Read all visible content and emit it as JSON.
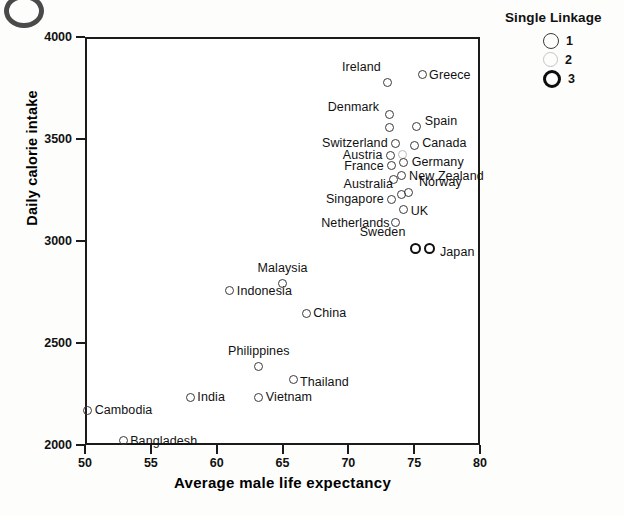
{
  "chart_data": {
    "type": "scatter",
    "title": "",
    "xlabel": "Average male life expectancy",
    "ylabel": "Daily calorie intake",
    "xlim": [
      50,
      80
    ],
    "ylim": [
      2000,
      4000
    ],
    "xticks": [
      50,
      55,
      60,
      65,
      70,
      75,
      80
    ],
    "yticks": [
      2000,
      2500,
      3000,
      3500,
      4000
    ],
    "grid": false,
    "legend": {
      "title": "Single Linkage",
      "position": "top-right-outside",
      "entries": [
        {
          "label": "1",
          "weight": "thin"
        },
        {
          "label": "2",
          "weight": "faint"
        },
        {
          "label": "3",
          "weight": "bold"
        }
      ]
    },
    "points": [
      {
        "name": "Ireland",
        "x": 73.0,
        "y": 3775,
        "linkage": 1,
        "label_pos": "r",
        "label_dx": -7,
        "label_dy": -16
      },
      {
        "name": "Greece",
        "x": 75.6,
        "y": 3815,
        "linkage": 1,
        "label_pos": "l",
        "label_dx": 7,
        "label_dy": 0
      },
      {
        "name": "Denmark",
        "x": 73.1,
        "y": 3620,
        "linkage": 1,
        "label_pos": "r",
        "label_dx": -10,
        "label_dy": -8
      },
      {
        "name": "Denmark2",
        "x": 73.1,
        "y": 3555,
        "linkage": 1,
        "label_pos": "none",
        "label_dx": 0,
        "label_dy": 0
      },
      {
        "name": "Spain",
        "x": 75.2,
        "y": 3560,
        "linkage": 1,
        "label_pos": "l",
        "label_dx": 8,
        "label_dy": -6
      },
      {
        "name": "Switzerland",
        "x": 73.6,
        "y": 3480,
        "linkage": 1,
        "label_pos": "r",
        "label_dx": -8,
        "label_dy": 0
      },
      {
        "name": "Canada",
        "x": 75.0,
        "y": 3470,
        "linkage": 1,
        "label_pos": "l",
        "label_dx": 8,
        "label_dy": -2
      },
      {
        "name": "Austria",
        "x": 73.2,
        "y": 3420,
        "linkage": 1,
        "label_pos": "r",
        "label_dx": -8,
        "label_dy": 0
      },
      {
        "name": "Austria2",
        "x": 74.1,
        "y": 3425,
        "linkage": 2,
        "label_pos": "none",
        "label_dx": 0,
        "label_dy": 0
      },
      {
        "name": "Germany",
        "x": 74.2,
        "y": 3385,
        "linkage": 1,
        "label_pos": "l",
        "label_dx": 8,
        "label_dy": 0
      },
      {
        "name": "France",
        "x": 73.3,
        "y": 3370,
        "linkage": 1,
        "label_pos": "r",
        "label_dx": -8,
        "label_dy": 0
      },
      {
        "name": "New Zealand",
        "x": 74.0,
        "y": 3320,
        "linkage": 1,
        "label_pos": "l",
        "label_dx": 8,
        "label_dy": 0
      },
      {
        "name": "NZ2",
        "x": 73.4,
        "y": 3300,
        "linkage": 1,
        "label_pos": "none",
        "label_dx": 0,
        "label_dy": 0
      },
      {
        "name": "Australia",
        "x": 74.0,
        "y": 3230,
        "linkage": 1,
        "label_pos": "r",
        "label_dx": -8,
        "label_dy": -10
      },
      {
        "name": "Norway",
        "x": 74.6,
        "y": 3240,
        "linkage": 1,
        "label_pos": "l",
        "label_dx": 10,
        "label_dy": -10
      },
      {
        "name": "Singapore",
        "x": 73.3,
        "y": 3205,
        "linkage": 1,
        "label_pos": "r",
        "label_dx": -8,
        "label_dy": 0
      },
      {
        "name": "UK",
        "x": 74.2,
        "y": 3155,
        "linkage": 1,
        "label_pos": "l",
        "label_dx": 7,
        "label_dy": 2
      },
      {
        "name": "Netherlands",
        "x": 73.6,
        "y": 3090,
        "linkage": 1,
        "label_pos": "r",
        "label_dx": -6,
        "label_dy": 0
      },
      {
        "name": "Sweden",
        "x": 75.1,
        "y": 2965,
        "linkage": 3,
        "label_pos": "r",
        "label_dx": -10,
        "label_dy": -16
      },
      {
        "name": "Japan",
        "x": 76.2,
        "y": 2965,
        "linkage": 3,
        "label_pos": "l",
        "label_dx": 10,
        "label_dy": 4
      },
      {
        "name": "Malaysia",
        "x": 65.0,
        "y": 2790,
        "linkage": 1,
        "label_pos": "c",
        "label_dx": 0,
        "label_dy": -16
      },
      {
        "name": "Indonesia",
        "x": 61.0,
        "y": 2755,
        "linkage": 1,
        "label_pos": "l",
        "label_dx": 7,
        "label_dy": 0
      },
      {
        "name": "China",
        "x": 66.8,
        "y": 2645,
        "linkage": 1,
        "label_pos": "l",
        "label_dx": 7,
        "label_dy": 0
      },
      {
        "name": "Philippines",
        "x": 63.2,
        "y": 2385,
        "linkage": 1,
        "label_pos": "c",
        "label_dx": 0,
        "label_dy": -15
      },
      {
        "name": "Thailand",
        "x": 65.8,
        "y": 2320,
        "linkage": 1,
        "label_pos": "l",
        "label_dx": 7,
        "label_dy": 2
      },
      {
        "name": "India",
        "x": 58.0,
        "y": 2235,
        "linkage": 1,
        "label_pos": "l",
        "label_dx": 7,
        "label_dy": 0
      },
      {
        "name": "Vietnam",
        "x": 63.2,
        "y": 2235,
        "linkage": 1,
        "label_pos": "l",
        "label_dx": 7,
        "label_dy": 0
      },
      {
        "name": "Cambodia",
        "x": 50.2,
        "y": 2170,
        "linkage": 1,
        "label_pos": "l",
        "label_dx": 7,
        "label_dy": 0
      },
      {
        "name": "Bangladesh",
        "x": 52.9,
        "y": 2020,
        "linkage": 1,
        "label_pos": "l",
        "label_dx": 7,
        "label_dy": 0
      }
    ]
  }
}
